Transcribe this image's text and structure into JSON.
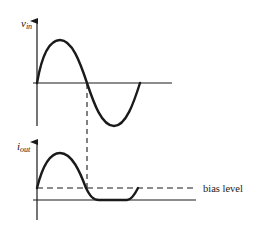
{
  "diagram": {
    "title": "",
    "colors": {
      "stroke": "#1a1a1a",
      "background": "#ffffff"
    },
    "top_plot": {
      "y_label_main": "v",
      "y_label_sub": "in",
      "description": "input voltage sine wave, one full cycle"
    },
    "bottom_plot": {
      "y_label_main": "i",
      "y_label_sub": "out",
      "description": "output current clipped below zero, biased above baseline"
    },
    "annotations": {
      "bias_label": "bias level"
    }
  }
}
